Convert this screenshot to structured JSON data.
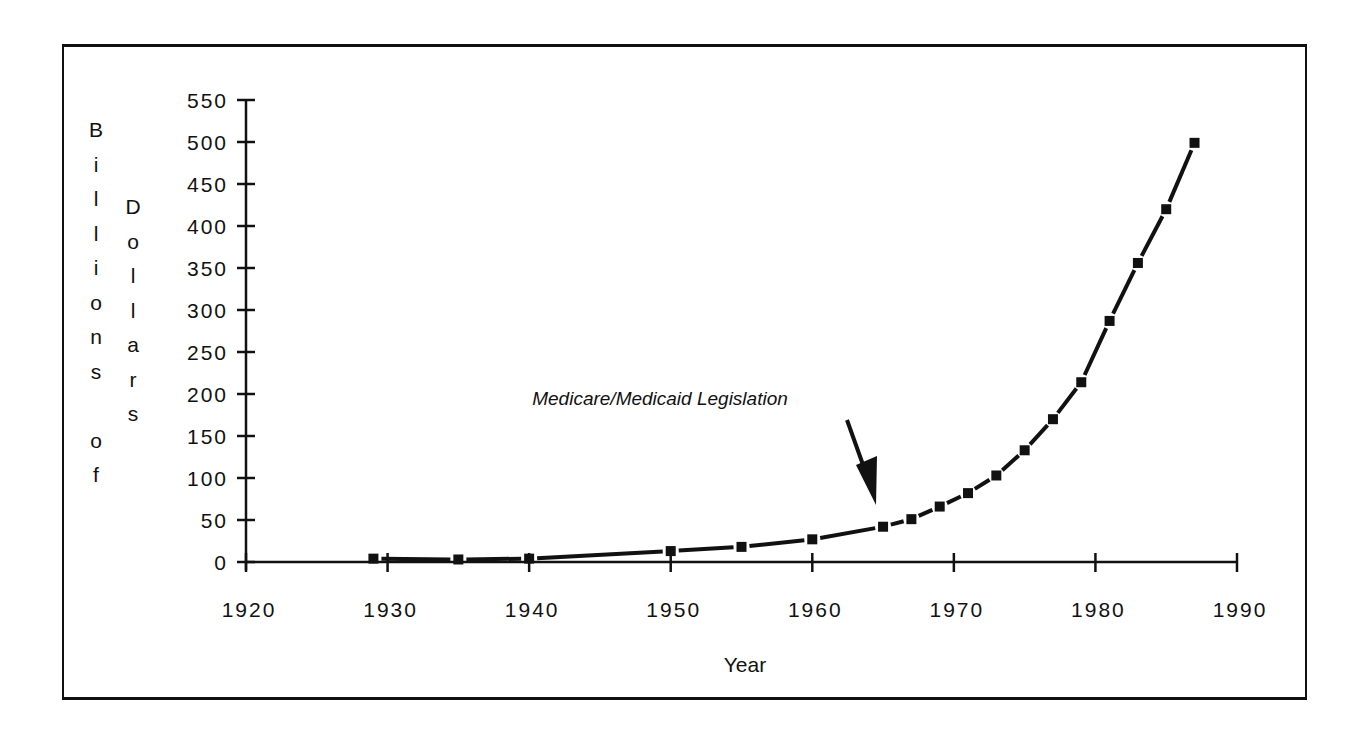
{
  "chart_data": {
    "type": "line",
    "title": "",
    "xlabel": "Year",
    "ylabel": "Billions of Dollars",
    "ylabel_stacked": [
      "Billions",
      "of",
      "Dollars"
    ],
    "xlim": [
      1920,
      1990
    ],
    "ylim": [
      0,
      550
    ],
    "x_ticks": [
      1920,
      1930,
      1940,
      1950,
      1960,
      1970,
      1980,
      1990
    ],
    "y_ticks": [
      0,
      50,
      100,
      150,
      200,
      250,
      300,
      350,
      400,
      450,
      500,
      550
    ],
    "grid": false,
    "legend": null,
    "marker": "square",
    "series": [
      {
        "name": "Billions of Dollars",
        "x": [
          1929,
          1935,
          1940,
          1950,
          1955,
          1960,
          1965,
          1967,
          1969,
          1971,
          1973,
          1975,
          1977,
          1979,
          1981,
          1983,
          1985,
          1987
        ],
        "values": [
          4,
          3,
          4,
          13,
          18,
          27,
          42,
          51,
          66,
          82,
          103,
          133,
          170,
          214,
          287,
          356,
          420,
          499
        ]
      }
    ],
    "annotations": [
      {
        "text": "Medicare/Medicaid Legislation",
        "arrow_to_year": 1965
      }
    ]
  },
  "labels": {
    "x_title": "Year",
    "y_col1": [
      "B",
      "i",
      "l",
      "l",
      "i",
      "o",
      "n",
      "s",
      "",
      "o",
      "f"
    ],
    "y_col2": [
      "D",
      "o",
      "l",
      "l",
      "a",
      "r",
      "s"
    ],
    "annotation": "Medicare/Medicaid Legislation"
  }
}
